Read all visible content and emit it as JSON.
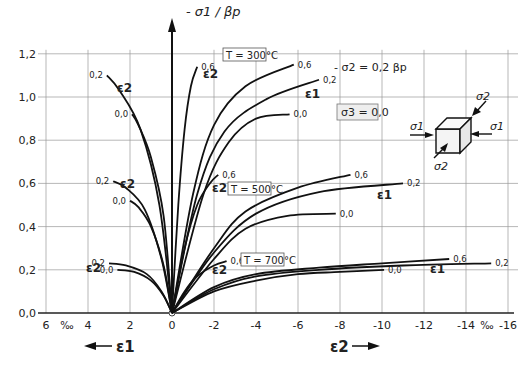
{
  "chart_data": {
    "type": "line",
    "title": "",
    "ylabel": "- σ1 / βp",
    "xlabel_left": "ε1",
    "xlabel_right": "ε2",
    "x_unit": "‰",
    "xlim": [
      6,
      -16
    ],
    "ylim": [
      0,
      1.2
    ],
    "grid": true,
    "x_ticks": [
      "6",
      "4",
      "2",
      "0",
      "-2",
      "-4",
      "-6",
      "-8",
      "-10",
      "-12",
      "-14",
      "-16"
    ],
    "y_ticks": [
      "0,0",
      "0,2",
      "0,4",
      "0,6",
      "0,8",
      "1,0",
      "1,2"
    ],
    "annotations": {
      "stress_ratio": "- σ2 = 0,2 βp",
      "sigma3": "σ3 = 0,0",
      "T300": "T = 300°C",
      "T500": "T = 500°C",
      "T700": "T = 700°C",
      "sigma1": "σ1",
      "sigma2": "σ2",
      "eps1": "ε1",
      "eps2": "ε2"
    },
    "series": [
      {
        "name": "T=300°C, ε2, 0,2",
        "temperature": 300,
        "strain": "ε2",
        "ratio": "0,2",
        "x": [
          0,
          0.6,
          1.5,
          2.5,
          3.1
        ],
        "y": [
          0,
          0.5,
          0.85,
          1.03,
          1.1
        ]
      },
      {
        "name": "T=300°C, ε2, 0,0",
        "temperature": 300,
        "strain": "ε2",
        "ratio": "0,0",
        "x": [
          0,
          0.4,
          1.0,
          1.6,
          1.9
        ],
        "y": [
          0,
          0.45,
          0.72,
          0.87,
          0.92
        ]
      },
      {
        "name": "T=300°C, ε2, 0,6",
        "temperature": 300,
        "strain": "ε2",
        "ratio": "0,6",
        "x": [
          0,
          -0.3,
          -0.6,
          -0.9,
          -1.2
        ],
        "y": [
          0,
          0.5,
          0.85,
          1.05,
          1.14
        ]
      },
      {
        "name": "T=300°C, ε1, 0,6",
        "temperature": 300,
        "strain": "ε1",
        "ratio": "0,6",
        "x": [
          0,
          -1,
          -2,
          -3.5,
          -5.8
        ],
        "y": [
          0,
          0.55,
          0.87,
          1.05,
          1.15
        ]
      },
      {
        "name": "T=300°C, ε1, 0,2",
        "temperature": 300,
        "strain": "ε1",
        "ratio": "0,2",
        "x": [
          0,
          -1.2,
          -2.5,
          -4.5,
          -7.0
        ],
        "y": [
          0,
          0.55,
          0.84,
          0.99,
          1.08
        ]
      },
      {
        "name": "T=300°C, ε1, 0,0",
        "temperature": 300,
        "strain": "ε1",
        "ratio": "0,0",
        "x": [
          0,
          -1.5,
          -2.7,
          -4,
          -5.6
        ],
        "y": [
          0,
          0.55,
          0.79,
          0.9,
          0.92
        ]
      },
      {
        "name": "T=500°C, ε2, 0,2",
        "temperature": 500,
        "strain": "ε2",
        "ratio": "0,2",
        "x": [
          0,
          0.5,
          1.3,
          2.2,
          2.8
        ],
        "y": [
          0,
          0.25,
          0.48,
          0.58,
          0.61
        ]
      },
      {
        "name": "T=500°C, ε2, 0,0",
        "temperature": 500,
        "strain": "ε2",
        "ratio": "0,0",
        "x": [
          0,
          0.4,
          1.0,
          1.6,
          2.0
        ],
        "y": [
          0,
          0.22,
          0.4,
          0.49,
          0.52
        ]
      },
      {
        "name": "T=500°C, ε2, 0,6",
        "temperature": 500,
        "strain": "ε2",
        "ratio": "0,6",
        "x": [
          0,
          -0.6,
          -1.2,
          -1.8,
          -2.2
        ],
        "y": [
          0,
          0.3,
          0.5,
          0.6,
          0.64
        ]
      },
      {
        "name": "T=500°C, ε1, 0,6",
        "temperature": 500,
        "strain": "ε1",
        "ratio": "0,6",
        "x": [
          0,
          -2,
          -3.5,
          -6,
          -8.5
        ],
        "y": [
          0,
          0.3,
          0.47,
          0.58,
          0.64
        ]
      },
      {
        "name": "T=500°C, ε1, 0,2",
        "temperature": 500,
        "strain": "ε1",
        "ratio": "0,2",
        "x": [
          0,
          -2,
          -4,
          -7,
          -11.0
        ],
        "y": [
          0,
          0.28,
          0.46,
          0.56,
          0.6
        ]
      },
      {
        "name": "T=500°C, ε1, 0,0",
        "temperature": 500,
        "strain": "ε1",
        "ratio": "0,0",
        "x": [
          0,
          -2,
          -3.5,
          -5.5,
          -7.8
        ],
        "y": [
          0,
          0.25,
          0.39,
          0.45,
          0.46
        ]
      },
      {
        "name": "T=700°C, ε2, 0,2",
        "temperature": 700,
        "strain": "ε2",
        "ratio": "0,2",
        "x": [
          0,
          0.5,
          1.2,
          2.2,
          3.0
        ],
        "y": [
          0,
          0.1,
          0.18,
          0.22,
          0.23
        ]
      },
      {
        "name": "T=700°C, ε2, 0,0",
        "temperature": 700,
        "strain": "ε2",
        "ratio": "0,0",
        "x": [
          0,
          0.4,
          1.0,
          1.8,
          2.6
        ],
        "y": [
          0,
          0.08,
          0.15,
          0.19,
          0.2
        ]
      },
      {
        "name": "T=700°C, ε2, 0,6",
        "temperature": 700,
        "strain": "ε2",
        "ratio": "0,6",
        "x": [
          0,
          -0.6,
          -1.2,
          -2,
          -2.6
        ],
        "y": [
          0,
          0.1,
          0.17,
          0.22,
          0.24
        ]
      },
      {
        "name": "T=700°C, ε1, 0,6",
        "temperature": 700,
        "strain": "ε1",
        "ratio": "0,6",
        "x": [
          0,
          -2,
          -4,
          -7,
          -10,
          -13.2
        ],
        "y": [
          0,
          0.12,
          0.18,
          0.21,
          0.23,
          0.25
        ]
      },
      {
        "name": "T=700°C, ε1, 0,2",
        "temperature": 700,
        "strain": "ε1",
        "ratio": "0,2",
        "x": [
          0,
          -2,
          -4,
          -7,
          -11,
          -15.2
        ],
        "y": [
          0,
          0.11,
          0.17,
          0.2,
          0.22,
          0.23
        ]
      },
      {
        "name": "T=700°C, ε1, 0,0",
        "temperature": 700,
        "strain": "ε1",
        "ratio": "0,0",
        "x": [
          0,
          -2,
          -4,
          -6,
          -8,
          -10.1
        ],
        "y": [
          0,
          0.1,
          0.15,
          0.18,
          0.19,
          0.2
        ]
      }
    ]
  }
}
